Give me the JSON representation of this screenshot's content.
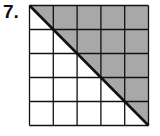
{
  "problem": {
    "number_label": "7.",
    "grid": {
      "rows": 5,
      "cols": 5
    },
    "shaded_region": "upper-right triangle above diagonal from top-left to bottom-right corner",
    "shaded_fraction": 0.5,
    "colors": {
      "shade": "#a8a8a8",
      "line": "#111111",
      "background": "#ffffff"
    }
  }
}
